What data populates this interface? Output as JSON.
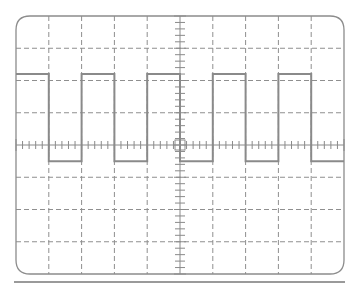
{
  "screen": {
    "type": "oscilloscope-graticule",
    "divisions_x": 10,
    "divisions_y": 8,
    "minor_per_division": 5,
    "frame": {
      "left": 16,
      "top": 16,
      "right": 344,
      "bottom": 274,
      "corner_radius": 14
    },
    "baseline": {
      "y": 282,
      "x1": 14,
      "x2": 345
    },
    "colors": {
      "frame": "#8c8c8c",
      "grid": "#8f8f8f",
      "axis": "#8a8a8a",
      "trace": "#8a8a8a",
      "baseline": "#9a9a9a",
      "background": "#ffffff"
    }
  },
  "trace": {
    "waveform": "square",
    "high_div": 2.2,
    "low_div": -0.5,
    "period_div": 2,
    "duty": 0.5,
    "start_phase": "high",
    "segments_div": [
      {
        "x0": 0,
        "x1": 1,
        "level": "high"
      },
      {
        "x0": 1,
        "x1": 2,
        "level": "low"
      },
      {
        "x0": 2,
        "x1": 3,
        "level": "high"
      },
      {
        "x0": 3,
        "x1": 4,
        "level": "low"
      },
      {
        "x0": 4,
        "x1": 5,
        "level": "high"
      },
      {
        "x0": 5,
        "x1": 6,
        "level": "low"
      },
      {
        "x0": 6,
        "x1": 7,
        "level": "high"
      },
      {
        "x0": 7,
        "x1": 8,
        "level": "low"
      },
      {
        "x0": 8,
        "x1": 9,
        "level": "high"
      },
      {
        "x0": 9,
        "x1": 10,
        "level": "low"
      }
    ]
  }
}
